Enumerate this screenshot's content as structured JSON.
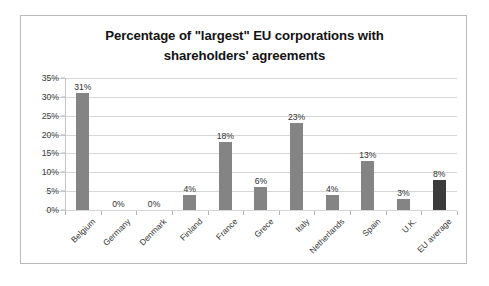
{
  "chart_data": {
    "type": "bar",
    "title": "Percentage of \"largest\" EU corporations with shareholders' agreements",
    "title_lines": [
      "Percentage of \"largest\" EU corporations with",
      "shareholders' agreements"
    ],
    "xlabel": "",
    "ylabel": "",
    "ylim": [
      0,
      35
    ],
    "ytick_labels": [
      "0%",
      "5%",
      "10%",
      "15%",
      "20%",
      "25%",
      "30%",
      "35%"
    ],
    "ytick_values": [
      0,
      5,
      10,
      15,
      20,
      25,
      30,
      35
    ],
    "grid": true,
    "legend": false,
    "categories": [
      "Belgium",
      "Germany",
      "Denmark",
      "Finland",
      "France",
      "Grece",
      "Italy",
      "Netherlands",
      "Spain",
      "U.K.",
      "EU average"
    ],
    "values": [
      31,
      0,
      0,
      4,
      18,
      6,
      23,
      4,
      13,
      3,
      8
    ],
    "data_labels": [
      "31%",
      "0%",
      "0%",
      "4%",
      "18%",
      "6%",
      "23%",
      "4%",
      "13%",
      "3%",
      "8%"
    ],
    "highlight_index": 10,
    "colors": {
      "bar": "#848484",
      "bar_highlight": "#3b3b3b",
      "gridline": "#d6d6d6",
      "axis": "#c4c4c4",
      "frame": "#b9b9b9",
      "text": "#2f2f2f",
      "background": "#ffffff"
    }
  }
}
